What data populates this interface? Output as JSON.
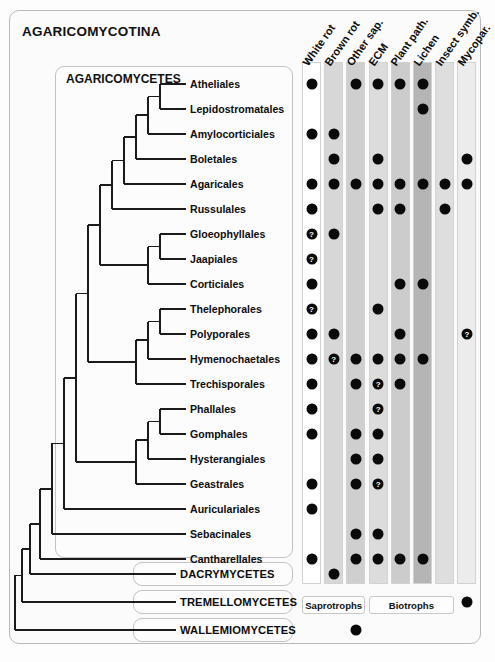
{
  "figure": {
    "subphylum_title": "AGARICOMYCOTINA",
    "class_agaricomycetes": "AGARICOMYCETES"
  },
  "columns": [
    {
      "id": "white-rot",
      "label": "White rot",
      "shade": "#ffffff",
      "group": "saprotrophs"
    },
    {
      "id": "brown-rot",
      "label": "Brown rot",
      "shade": "#d7d7d7",
      "group": "saprotrophs"
    },
    {
      "id": "other-sap",
      "label": "Other sap.",
      "shade": "#cfcfcf",
      "group": "saprotrophs"
    },
    {
      "id": "ecm",
      "label": "ECM",
      "shade": "#dcdcdc",
      "group": "biotrophs"
    },
    {
      "id": "plant-path",
      "label": "Plant path.",
      "shade": "#cccccc",
      "group": "biotrophs"
    },
    {
      "id": "lichen",
      "label": "Lichen",
      "shade": "#b5b5b5",
      "group": "biotrophs"
    },
    {
      "id": "insect-symb",
      "label": "Insect symb.",
      "shade": "#dedede",
      "group": "biotrophs"
    },
    {
      "id": "mycopar",
      "label": "Mycopar.",
      "shade": "#ececec",
      "group": "none"
    }
  ],
  "groups": [
    {
      "id": "saprotrophs",
      "label": "Saprotrophs"
    },
    {
      "id": "biotrophs",
      "label": "Biotrophs"
    }
  ],
  "taxa": [
    {
      "name": "Atheliales",
      "rank": "order",
      "states": {
        "white-rot": "yes",
        "brown-rot": "no",
        "other-sap": "yes",
        "ecm": "yes",
        "plant-path": "yes",
        "lichen": "yes",
        "insect-symb": "no",
        "mycopar": "no"
      }
    },
    {
      "name": "Lepidostromatales",
      "rank": "order",
      "states": {
        "white-rot": "no",
        "brown-rot": "no",
        "other-sap": "no",
        "ecm": "no",
        "plant-path": "no",
        "lichen": "yes",
        "insect-symb": "no",
        "mycopar": "no"
      }
    },
    {
      "name": "Amylocorticiales",
      "rank": "order",
      "states": {
        "white-rot": "yes",
        "brown-rot": "yes",
        "other-sap": "no",
        "ecm": "no",
        "plant-path": "no",
        "lichen": "no",
        "insect-symb": "no",
        "mycopar": "no"
      }
    },
    {
      "name": "Boletales",
      "rank": "order",
      "states": {
        "white-rot": "no",
        "brown-rot": "yes",
        "other-sap": "no",
        "ecm": "yes",
        "plant-path": "no",
        "lichen": "no",
        "insect-symb": "no",
        "mycopar": "yes"
      }
    },
    {
      "name": "Agaricales",
      "rank": "order",
      "states": {
        "white-rot": "yes",
        "brown-rot": "yes",
        "other-sap": "yes",
        "ecm": "yes",
        "plant-path": "yes",
        "lichen": "yes",
        "insect-symb": "yes",
        "mycopar": "yes"
      }
    },
    {
      "name": "Russulales",
      "rank": "order",
      "states": {
        "white-rot": "yes",
        "brown-rot": "no",
        "other-sap": "no",
        "ecm": "yes",
        "plant-path": "yes",
        "lichen": "no",
        "insect-symb": "yes",
        "mycopar": "no"
      }
    },
    {
      "name": "Gloeophyllales",
      "rank": "order",
      "states": {
        "white-rot": "unknown",
        "brown-rot": "yes",
        "other-sap": "no",
        "ecm": "no",
        "plant-path": "no",
        "lichen": "no",
        "insect-symb": "no",
        "mycopar": "no"
      }
    },
    {
      "name": "Jaapiales",
      "rank": "order",
      "states": {
        "white-rot": "unknown",
        "brown-rot": "no",
        "other-sap": "no",
        "ecm": "no",
        "plant-path": "no",
        "lichen": "no",
        "insect-symb": "no",
        "mycopar": "no"
      }
    },
    {
      "name": "Corticiales",
      "rank": "order",
      "states": {
        "white-rot": "yes",
        "brown-rot": "no",
        "other-sap": "no",
        "ecm": "no",
        "plant-path": "yes",
        "lichen": "yes",
        "insect-symb": "no",
        "mycopar": "no"
      }
    },
    {
      "name": "Thelephorales",
      "rank": "order",
      "states": {
        "white-rot": "unknown",
        "brown-rot": "no",
        "other-sap": "no",
        "ecm": "yes",
        "plant-path": "no",
        "lichen": "no",
        "insect-symb": "no",
        "mycopar": "no"
      }
    },
    {
      "name": "Polyporales",
      "rank": "order",
      "states": {
        "white-rot": "yes",
        "brown-rot": "yes",
        "other-sap": "no",
        "ecm": "no",
        "plant-path": "yes",
        "lichen": "no",
        "insect-symb": "no",
        "mycopar": "unknown"
      }
    },
    {
      "name": "Hymenochaetales",
      "rank": "order",
      "states": {
        "white-rot": "yes",
        "brown-rot": "unknown",
        "other-sap": "yes",
        "ecm": "yes",
        "plant-path": "yes",
        "lichen": "yes",
        "insect-symb": "no",
        "mycopar": "no"
      }
    },
    {
      "name": "Trechisporales",
      "rank": "order",
      "states": {
        "white-rot": "yes",
        "brown-rot": "no",
        "other-sap": "yes",
        "ecm": "unknown",
        "plant-path": "yes",
        "lichen": "no",
        "insect-symb": "no",
        "mycopar": "no"
      }
    },
    {
      "name": "Phallales",
      "rank": "order",
      "states": {
        "white-rot": "yes",
        "brown-rot": "no",
        "other-sap": "no",
        "ecm": "unknown",
        "plant-path": "no",
        "lichen": "no",
        "insect-symb": "no",
        "mycopar": "no"
      }
    },
    {
      "name": "Gomphales",
      "rank": "order",
      "states": {
        "white-rot": "yes",
        "brown-rot": "no",
        "other-sap": "yes",
        "ecm": "yes",
        "plant-path": "no",
        "lichen": "no",
        "insect-symb": "no",
        "mycopar": "no"
      }
    },
    {
      "name": "Hysterangiales",
      "rank": "order",
      "states": {
        "white-rot": "no",
        "brown-rot": "no",
        "other-sap": "yes",
        "ecm": "yes",
        "plant-path": "no",
        "lichen": "no",
        "insect-symb": "no",
        "mycopar": "no"
      }
    },
    {
      "name": "Geastrales",
      "rank": "order",
      "states": {
        "white-rot": "yes",
        "brown-rot": "no",
        "other-sap": "yes",
        "ecm": "unknown",
        "plant-path": "no",
        "lichen": "no",
        "insect-symb": "no",
        "mycopar": "no"
      }
    },
    {
      "name": "Auriculariales",
      "rank": "order",
      "states": {
        "white-rot": "yes",
        "brown-rot": "no",
        "other-sap": "no",
        "ecm": "no",
        "plant-path": "no",
        "lichen": "no",
        "insect-symb": "no",
        "mycopar": "no"
      }
    },
    {
      "name": "Sebacinales",
      "rank": "order",
      "states": {
        "white-rot": "no",
        "brown-rot": "no",
        "other-sap": "yes",
        "ecm": "yes",
        "plant-path": "no",
        "lichen": "no",
        "insect-symb": "no",
        "mycopar": "no"
      }
    },
    {
      "name": "Cantharellales",
      "rank": "order",
      "states": {
        "white-rot": "yes",
        "brown-rot": "no",
        "other-sap": "yes",
        "ecm": "yes",
        "plant-path": "yes",
        "lichen": "yes",
        "insect-symb": "no",
        "mycopar": "no"
      }
    },
    {
      "name": "DACRYMYCETES",
      "rank": "class",
      "states": {
        "white-rot": "no",
        "brown-rot": "yes",
        "other-sap": "no",
        "ecm": "no",
        "plant-path": "no",
        "lichen": "no",
        "insect-symb": "no",
        "mycopar": "no"
      }
    },
    {
      "name": "TREMELLOMYCETES",
      "rank": "class",
      "states": {
        "white-rot": "no",
        "brown-rot": "no",
        "other-sap": "no",
        "ecm": "no",
        "plant-path": "no",
        "lichen": "no",
        "insect-symb": "no",
        "mycopar": "yes"
      }
    },
    {
      "name": "WALLEMIOMYCETES",
      "rank": "class",
      "states": {
        "white-rot": "no",
        "brown-rot": "no",
        "other-sap": "yes",
        "ecm": "no",
        "plant-path": "no",
        "lichen": "no",
        "insect-symb": "no",
        "mycopar": "no"
      }
    }
  ],
  "uncertain_glyph": "?"
}
